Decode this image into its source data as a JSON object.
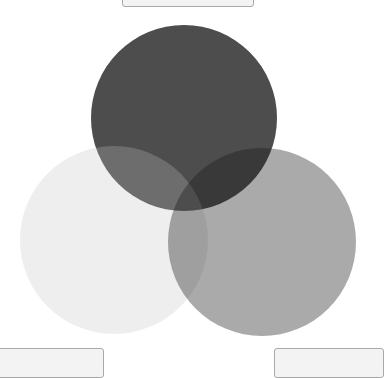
{
  "drop_slots": {
    "top": {
      "label": ""
    },
    "bottom_left": {
      "label": ""
    },
    "bottom_right": {
      "label": ""
    }
  },
  "venn": {
    "circles": [
      {
        "name": "top",
        "cx": 184,
        "cy": 118,
        "r": 93,
        "fill": "#4d4d4d",
        "opacity": 1
      },
      {
        "name": "left",
        "cx": 114,
        "cy": 240,
        "r": 94,
        "fill": "#c2c2c2",
        "opacity": 0.28
      },
      {
        "name": "right",
        "cx": 262,
        "cy": 242,
        "r": 94,
        "fill": "#161616",
        "opacity": 0.365
      }
    ]
  }
}
